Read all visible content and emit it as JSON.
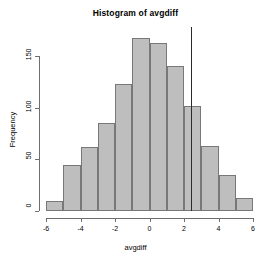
{
  "chart_data": {
    "type": "bar",
    "title": "Histogram of avgdiff",
    "xlabel": "avgdiff",
    "ylabel": "Frequency",
    "categories": [
      "-6 to -5",
      "-5 to -4",
      "-4 to -3",
      "-3 to -2",
      "-2 to -1",
      "-1 to 0",
      "0 to 1",
      "1 to 2",
      "2 to 3",
      "3 to 4",
      "4 to 5",
      "5 to 6"
    ],
    "bin_edges": [
      -6,
      -5,
      -4,
      -3,
      -2,
      -1,
      0,
      1,
      2,
      3,
      4,
      5,
      6
    ],
    "values": [
      10,
      45,
      62,
      85,
      123,
      167,
      163,
      140,
      102,
      63,
      35,
      13
    ],
    "xlim": [
      -6,
      6
    ],
    "ylim": [
      0,
      150
    ],
    "x_ticks": [
      -6,
      -4,
      -2,
      0,
      2,
      4,
      6
    ],
    "x_tick_labels": [
      "-6",
      "-4",
      "-2",
      "0",
      "2",
      "4",
      "6"
    ],
    "y_ticks": [
      0,
      50,
      100,
      150
    ],
    "y_tick_labels": [
      "0",
      "50",
      "100",
      "150"
    ],
    "grid": false,
    "legend": null,
    "annotations": [
      {
        "type": "vertical-line",
        "x": 2.4,
        "color": "#2b2b2b",
        "label": ""
      }
    ],
    "bar_fill_color": "#bebebe",
    "bar_border_color": "#787878",
    "axis_color": "#6e6e6e"
  }
}
